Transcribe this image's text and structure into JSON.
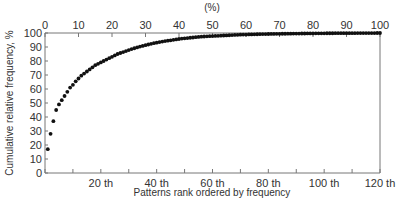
{
  "chart_data": {
    "type": "scatter",
    "title": "",
    "xlabel": "Patterns rank ordered by frequency",
    "ylabel": "Cumulative relative frequency, %",
    "top_xlabel": "(%)",
    "xlim": [
      0,
      120
    ],
    "ylim": [
      0,
      100
    ],
    "top_xlim": [
      0,
      100
    ],
    "grid": false,
    "legend": null,
    "x_ticks": [
      0,
      10,
      20,
      30,
      40,
      50,
      60,
      70,
      80,
      90,
      100,
      110,
      120
    ],
    "x_tick_labels": [
      {
        "value": 20,
        "label": "20 th"
      },
      {
        "value": 40,
        "label": "40 th"
      },
      {
        "value": 60,
        "label": "60 th"
      },
      {
        "value": 80,
        "label": "80 th"
      },
      {
        "value": 100,
        "label": "100 th"
      },
      {
        "value": 120,
        "label": "120 th"
      }
    ],
    "top_x_tick_labels": [
      "0",
      "10",
      "20",
      "30",
      "40",
      "50",
      "60",
      "70",
      "80",
      "90",
      "100"
    ],
    "y_tick_labels": [
      "0",
      "10",
      "20",
      "30",
      "40",
      "50",
      "60",
      "70",
      "80",
      "90",
      "100"
    ],
    "series": [
      {
        "name": "Cumulative relative frequency",
        "x": [
          1,
          2,
          3,
          4,
          5,
          6,
          7,
          8,
          9,
          10,
          11,
          12,
          13,
          14,
          15,
          16,
          17,
          18,
          19,
          20,
          21,
          22,
          23,
          24,
          25,
          26,
          27,
          28,
          29,
          30,
          31,
          32,
          33,
          34,
          35,
          36,
          37,
          38,
          39,
          40,
          41,
          42,
          43,
          44,
          45,
          46,
          47,
          48,
          49,
          50,
          51,
          52,
          53,
          54,
          55,
          56,
          57,
          58,
          59,
          60,
          61,
          62,
          63,
          64,
          65,
          66,
          67,
          68,
          69,
          70,
          71,
          72,
          73,
          74,
          75,
          76,
          77,
          78,
          79,
          80,
          81,
          82,
          83,
          84,
          85,
          86,
          87,
          88,
          89,
          90,
          91,
          92,
          93,
          94,
          95,
          96,
          97,
          98,
          99,
          100,
          101,
          102,
          103,
          104,
          105,
          106,
          107,
          108,
          109,
          110,
          111,
          112,
          113,
          114,
          115,
          116,
          117,
          118,
          119,
          120
        ],
        "values": [
          17,
          28,
          37,
          45,
          49,
          52,
          55,
          58,
          61,
          63,
          65.5,
          67.5,
          69.5,
          71,
          72.5,
          74,
          75.5,
          77,
          78,
          79,
          80,
          81,
          82,
          83,
          84,
          85,
          85.7,
          86.4,
          87.1,
          87.8,
          88.5,
          89.1,
          89.7,
          90.3,
          90.8,
          91.3,
          91.8,
          92.3,
          92.7,
          93.1,
          93.5,
          93.9,
          94.2,
          94.5,
          94.8,
          95.1,
          95.4,
          95.7,
          96,
          96.2,
          96.4,
          96.6,
          96.8,
          97,
          97.2,
          97.4,
          97.5,
          97.6,
          97.7,
          97.8,
          97.9,
          98,
          98.1,
          98.2,
          98.3,
          98.4,
          98.5,
          98.6,
          98.7,
          98.8,
          98.85,
          98.9,
          98.95,
          99,
          99.05,
          99.1,
          99.15,
          99.2,
          99.25,
          99.3,
          99.33,
          99.36,
          99.39,
          99.42,
          99.45,
          99.48,
          99.51,
          99.54,
          99.57,
          99.6,
          99.62,
          99.64,
          99.66,
          99.68,
          99.7,
          99.72,
          99.74,
          99.76,
          99.78,
          99.8,
          99.81,
          99.82,
          99.83,
          99.84,
          99.85,
          99.86,
          99.87,
          99.88,
          99.89,
          99.9,
          99.91,
          99.92,
          99.93,
          99.94,
          99.95,
          99.96,
          99.97,
          99.98,
          99.99,
          100
        ]
      }
    ]
  }
}
